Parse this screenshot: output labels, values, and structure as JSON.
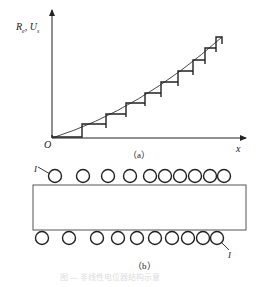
{
  "figure": {
    "panel_a": {
      "y_axis_label": "R",
      "y_axis_label_sub": "e",
      "y_axis_label_sep": ", ",
      "y_axis_label2": "U",
      "y_axis_label2_sub": "s",
      "x_axis_label": "x",
      "origin_label": "O",
      "caption": "（a）",
      "step_count": 11,
      "curve": "smooth ideal curve from origin rising to upper right",
      "staircase_levels_px": [
        137,
        124,
        114,
        103,
        93,
        82,
        71,
        60,
        48,
        37
      ]
    },
    "panel_b": {
      "caption": "（b）",
      "top_label": "I",
      "bottom_label": "I",
      "top_circle_count": 10,
      "bottom_circle_count": 10,
      "description": "rectangular core with turns (circles) spaced non-uniformly, denser toward the right"
    },
    "title_faint": "图 — 非线性电位器结构示意"
  }
}
